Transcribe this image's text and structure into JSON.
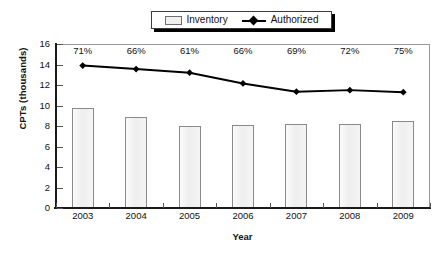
{
  "chart_data": {
    "type": "bar",
    "title": "",
    "xlabel": "Year",
    "ylabel": "CPTs (thousands)",
    "categories": [
      "2003",
      "2004",
      "2005",
      "2006",
      "2007",
      "2008",
      "2009"
    ],
    "ylim": [
      0,
      16
    ],
    "ytick_values": [
      0,
      2,
      4,
      6,
      8,
      10,
      12,
      14,
      16
    ],
    "ytick_labels": [
      "0",
      "2",
      "4",
      "6",
      "8",
      "10",
      "12",
      "14",
      "16"
    ],
    "grid": false,
    "legend_position": "top-center",
    "series": [
      {
        "name": "Inventory",
        "type": "bar",
        "values": [
          9.8,
          8.85,
          8.0,
          8.05,
          8.15,
          8.2,
          8.5
        ]
      },
      {
        "name": "Authorized",
        "type": "line",
        "values": [
          13.9,
          13.55,
          13.2,
          12.15,
          11.35,
          11.5,
          11.3
        ]
      }
    ],
    "annotations": [
      "71%",
      "66%",
      "61%",
      "66%",
      "69%",
      "72%",
      "75%"
    ]
  },
  "legend": {
    "items": [
      {
        "label": "Inventory",
        "marker": "filled-square-swatch"
      },
      {
        "label": "Authorized",
        "marker": "line-with-diamond-marker"
      }
    ]
  },
  "axes": {
    "x_title": "Year",
    "y_title": "CPTs (thousands)"
  },
  "colors": {
    "bar_fill": "#f0f0f0",
    "bar_border": "#8a8a8a",
    "line": "#000000",
    "axis": "#1a1a1a",
    "text": "#111111",
    "plot_border": "#999999",
    "background": "#ffffff"
  }
}
